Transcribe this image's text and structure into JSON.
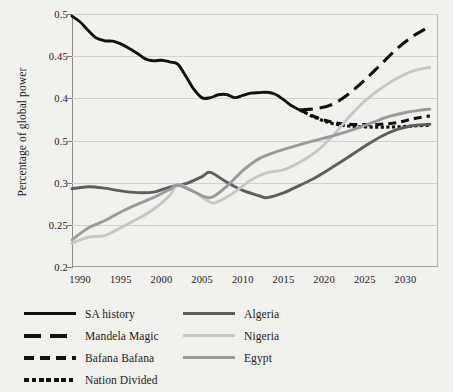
{
  "chart_data": {
    "type": "line",
    "title": "",
    "xlabel": "",
    "ylabel": "Percentage of global power",
    "xlim": [
      1989,
      2034
    ],
    "ylim": [
      0.2,
      0.5
    ],
    "grid": true,
    "legend_position": "bottom",
    "x_ticks": [
      "1990",
      "1995",
      "2000",
      "2005",
      "2010",
      "2015",
      "2020",
      "2025",
      "2030"
    ],
    "x_tick_values": [
      1990,
      1995,
      2000,
      2005,
      2010,
      2015,
      2020,
      2025,
      2030
    ],
    "y_ticks": [
      "0.5",
      "0.45",
      "0.4",
      "0.5",
      "0.3",
      "0.25",
      "0.2"
    ],
    "y_tick_values": [
      0.5,
      0.45,
      0.4,
      0.35,
      0.3,
      0.25,
      0.2
    ],
    "series": [
      {
        "name": "SA history",
        "style": "solid",
        "color": "#111111",
        "x": [
          1989,
          1990,
          1991,
          1992,
          1993,
          1994,
          1995,
          1996,
          1997,
          1998,
          1999,
          2000,
          2001,
          2002,
          2003,
          2004,
          2005,
          2006,
          2007,
          2008,
          2009,
          2010,
          2011,
          2012,
          2013,
          2014,
          2015,
          2016,
          2017
        ],
        "y": [
          0.4975,
          0.4905,
          0.4805,
          0.4715,
          0.4683,
          0.4678,
          0.4645,
          0.4595,
          0.4535,
          0.4468,
          0.4445,
          0.4452,
          0.4432,
          0.4405,
          0.4262,
          0.4105,
          0.4005,
          0.4008,
          0.4042,
          0.4045,
          0.4008,
          0.4035,
          0.4062,
          0.4068,
          0.4072,
          0.4048,
          0.3985,
          0.3912,
          0.3862
        ]
      },
      {
        "name": "Mandela Magic",
        "style": "long-dash",
        "color": "#111111",
        "x": [
          2017,
          2019,
          2021,
          2023,
          2025,
          2027,
          2029,
          2031,
          2033
        ],
        "y": [
          0.3862,
          0.3878,
          0.3928,
          0.4052,
          0.4218,
          0.4405,
          0.4592,
          0.4742,
          0.4852
        ]
      },
      {
        "name": "Bafana Bafana",
        "style": "dash",
        "color": "#111111",
        "x": [
          2017,
          2019,
          2021,
          2023,
          2025,
          2027,
          2029,
          2031,
          2033
        ],
        "y": [
          0.3862,
          0.3775,
          0.3718,
          0.3692,
          0.3688,
          0.3692,
          0.3712,
          0.3758,
          0.3792
        ]
      },
      {
        "name": "Nation Divided",
        "style": "dotted",
        "color": "#111111",
        "x": [
          2017,
          2019,
          2021,
          2023,
          2025,
          2027,
          2029,
          2031,
          2033
        ],
        "y": [
          0.3862,
          0.3768,
          0.3702,
          0.3672,
          0.3662,
          0.3658,
          0.3662,
          0.3672,
          0.3682
        ]
      },
      {
        "name": "Algeria",
        "style": "solid",
        "color": "#5e5e5e",
        "x": [
          1989,
          1991,
          1993,
          1995,
          1997,
          1999,
          2001,
          2003,
          2005,
          2006,
          2008,
          2010,
          2012,
          2013,
          2015,
          2017,
          2019,
          2021,
          2023,
          2025,
          2027,
          2029,
          2031,
          2033
        ],
        "y": [
          0.2928,
          0.2952,
          0.2935,
          0.2902,
          0.2882,
          0.2888,
          0.2948,
          0.2988,
          0.3072,
          0.3122,
          0.3008,
          0.2908,
          0.2845,
          0.2822,
          0.2878,
          0.2968,
          0.3065,
          0.3182,
          0.3305,
          0.3432,
          0.3548,
          0.3632,
          0.3678,
          0.3692
        ]
      },
      {
        "name": "Nigeria",
        "style": "solid",
        "color": "#c6c6c6",
        "x": [
          1989,
          1991,
          1993,
          1995,
          1997,
          1999,
          2001,
          2002,
          2004,
          2006,
          2007,
          2009,
          2011,
          2013,
          2015,
          2017,
          2019,
          2021,
          2023,
          2025,
          2027,
          2029,
          2031,
          2033
        ],
        "y": [
          0.2282,
          0.2355,
          0.2372,
          0.2465,
          0.2568,
          0.2682,
          0.2845,
          0.2975,
          0.2895,
          0.2768,
          0.2778,
          0.2888,
          0.3032,
          0.3118,
          0.3152,
          0.3242,
          0.3368,
          0.3548,
          0.3772,
          0.3968,
          0.4118,
          0.4238,
          0.4325,
          0.4368
        ]
      },
      {
        "name": "Egypt",
        "style": "solid",
        "color": "#9a9a9a",
        "x": [
          1989,
          1991,
          1993,
          1995,
          1997,
          1999,
          2001,
          2002,
          2004,
          2006,
          2008,
          2010,
          2012,
          2014,
          2016,
          2018,
          2020,
          2022,
          2024,
          2026,
          2028,
          2030,
          2032,
          2033
        ],
        "y": [
          0.2322,
          0.2462,
          0.2548,
          0.2652,
          0.2742,
          0.2822,
          0.2918,
          0.2972,
          0.2892,
          0.2822,
          0.2955,
          0.3142,
          0.3285,
          0.3362,
          0.3422,
          0.3478,
          0.3528,
          0.3582,
          0.3645,
          0.3715,
          0.3785,
          0.3832,
          0.3862,
          0.3872
        ]
      }
    ]
  },
  "legend": {
    "left_column": [
      {
        "label": "SA history",
        "style": "solid",
        "color": "#111111"
      },
      {
        "label": "Mandela Magic",
        "style": "long-dash",
        "color": "#111111"
      },
      {
        "label": "Bafana Bafana",
        "style": "dash",
        "color": "#111111"
      },
      {
        "label": "Nation Divided",
        "style": "dotted",
        "color": "#111111"
      }
    ],
    "right_column": [
      {
        "label": "Algeria",
        "style": "solid",
        "color": "#5e5e5e"
      },
      {
        "label": "Nigeria",
        "style": "solid",
        "color": "#c6c6c6"
      },
      {
        "label": "Egypt",
        "style": "solid",
        "color": "#9a9a9a"
      }
    ]
  }
}
